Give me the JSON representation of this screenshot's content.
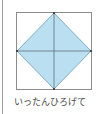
{
  "figure": {
    "square": {
      "x": 16,
      "y": 12,
      "size": 76,
      "stroke": "#8c8c8c"
    },
    "diamond": {
      "fill": "#b9dff0",
      "stroke": "#5a8fa8"
    },
    "cross_lines": {
      "stroke": "#5e6f78"
    },
    "vertex_dots": {
      "color": "#333333"
    }
  },
  "caption": {
    "text": "いったんひろげて"
  },
  "colors": {
    "fill": "#b9dff0",
    "outline": "#8c8c8c",
    "text": "#4a4a4a"
  }
}
